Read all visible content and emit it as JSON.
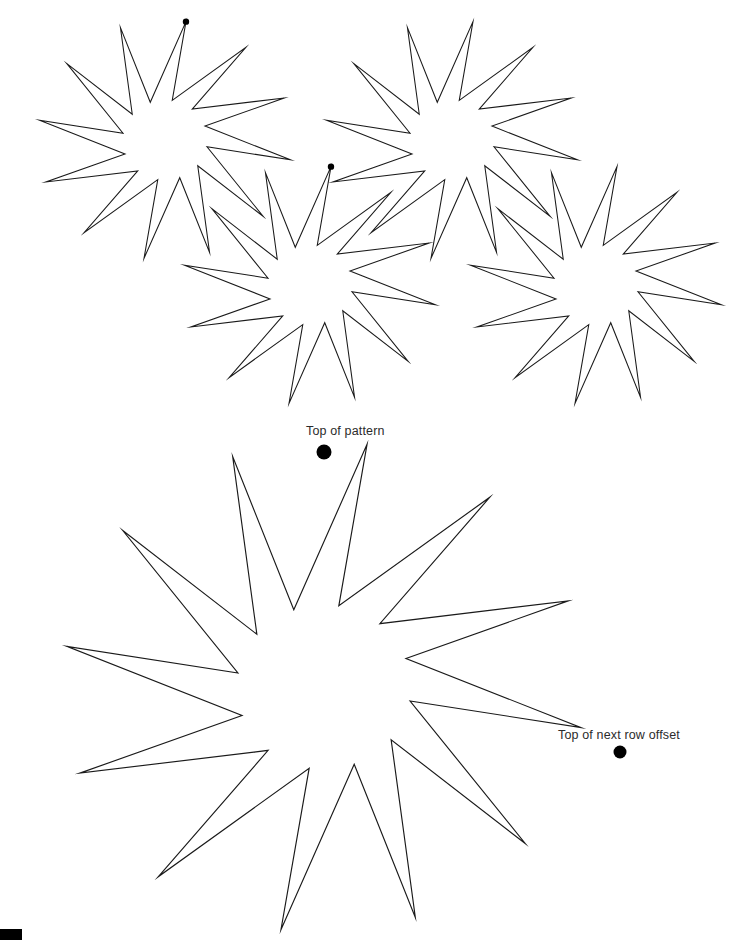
{
  "page": {
    "width": 729,
    "height": 940,
    "background": "#ffffff",
    "stroke_color": "#1a1a1a",
    "dot_color": "#000000",
    "text_color": "#2b2b2b"
  },
  "labels": {
    "top_of_pattern": "Top of pattern",
    "next_row_offset": "Top of next row offset"
  },
  "corner_mark": {
    "x": 0,
    "y": 929,
    "width": 22,
    "height": 12,
    "color": "#000000"
  },
  "chart_data": {
    "type": "diagram",
    "title": "Top of pattern",
    "star_geometry": {
      "points": 12,
      "outer_radius_ratio": 1.0,
      "inner_radius_ratio": 0.335,
      "skew_degrees": 9.5,
      "aspect_x": 1.06,
      "aspect_y": 1.0,
      "start_angle_degrees": -90
    },
    "stars": [
      {
        "id": "tile-1",
        "cx": 165,
        "cy": 140,
        "r": 120,
        "dot": true,
        "dot_radius": 3.2,
        "row": 1,
        "col": 1
      },
      {
        "id": "tile-2",
        "cx": 452,
        "cy": 140,
        "r": 120,
        "dot": false,
        "dot_radius": 0,
        "row": 1,
        "col": 2
      },
      {
        "id": "tile-3",
        "cx": 310,
        "cy": 285,
        "r": 120,
        "dot": true,
        "dot_radius": 3.2,
        "row": 2,
        "col": 1
      },
      {
        "id": "tile-4",
        "cx": 596,
        "cy": 285,
        "r": 120,
        "dot": false,
        "dot_radius": 0,
        "row": 2,
        "col": 2
      },
      {
        "id": "main",
        "cx": 324,
        "cy": 687,
        "r": 246,
        "dot": true,
        "dot_radius": 7.5,
        "row": 0,
        "col": 0
      }
    ],
    "markers": [
      {
        "id": "top-of-pattern-dot",
        "cx": 324,
        "cy": 452,
        "r": 7.5,
        "label": "Top of pattern"
      },
      {
        "id": "next-row-offset-dot",
        "cx": 620,
        "cy": 752,
        "r": 6.5,
        "label": "Top of next row offset"
      }
    ],
    "tiling": {
      "horizontal_spacing": 286,
      "vertical_spacing": 145,
      "row_offset_x": 145
    }
  }
}
